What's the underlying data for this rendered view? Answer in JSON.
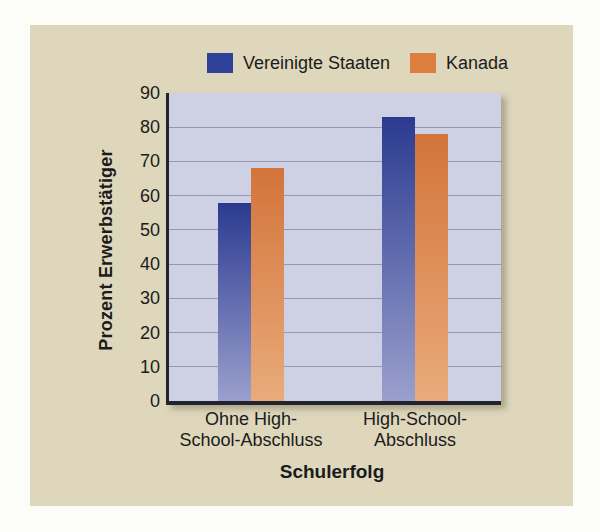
{
  "colors": {
    "page_bg": "#fcfcf9",
    "card_bg": "#ded7bb",
    "plot_bg": "#ced1e3",
    "grid": "#9598b0",
    "axis": "#23232d",
    "text": "#1b1b1b",
    "us_bar_top": "#2b3a90",
    "us_bar_bottom": "#9aa0cd",
    "ca_bar_top": "#d3743a",
    "ca_bar_bottom": "#e9ab7b",
    "legend_us": "#2e4097",
    "legend_ca": "#db7e3e"
  },
  "legend": [
    {
      "label": "Vereinigte Staaten",
      "color": "#2e4097"
    },
    {
      "label": "Kanada",
      "color": "#db7e3e"
    }
  ],
  "chart_data": {
    "type": "bar",
    "title": "",
    "categories": [
      "Ohne High-School-Abschluss",
      "High-School-Abschluss"
    ],
    "category_lines": [
      [
        "Ohne High-",
        "School-Abschluss"
      ],
      [
        "High-School-",
        "Abschluss"
      ]
    ],
    "series": [
      {
        "name": "Vereinigte Staaten",
        "values": [
          58,
          83
        ]
      },
      {
        "name": "Kanada",
        "values": [
          68,
          78
        ]
      }
    ],
    "xlabel": "Schulerfolg",
    "ylabel": "Prozent Erwerbstätiger",
    "ylim": [
      0,
      90
    ],
    "yticks": [
      0,
      10,
      20,
      30,
      40,
      50,
      60,
      70,
      80,
      90
    ],
    "grid": true,
    "legend_position": "top"
  }
}
